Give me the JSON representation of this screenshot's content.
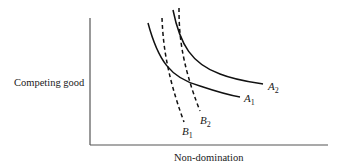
{
  "diagram": {
    "type": "indifference-curves",
    "y_axis_label": "Competing good",
    "x_axis_label": "Non-domination",
    "curves": [
      {
        "id": "A1",
        "letter": "A",
        "subscript": "1",
        "style": "solid"
      },
      {
        "id": "A2",
        "letter": "A",
        "subscript": "2",
        "style": "solid"
      },
      {
        "id": "B1",
        "letter": "B",
        "subscript": "1",
        "style": "dashed"
      },
      {
        "id": "B2",
        "letter": "B",
        "subscript": "2",
        "style": "dashed"
      }
    ]
  }
}
